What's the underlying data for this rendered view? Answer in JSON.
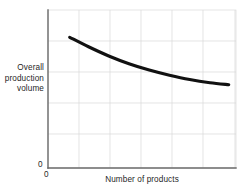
{
  "chart_data": {
    "type": "line",
    "title": "",
    "subtitle": "",
    "xlabel": "Number of products",
    "ylabel": "Overall production volume",
    "ylabel_lines": [
      "Overall",
      "production",
      "volume"
    ],
    "x_origin_label": "0",
    "y_origin_label": "0",
    "grid": true,
    "legend": null,
    "xlim": [
      0,
      6.5
    ],
    "ylim": [
      0,
      5.5
    ],
    "x_tick_labels": [],
    "y_tick_labels": [],
    "x_gridline_values": [
      1,
      2,
      3,
      4,
      5,
      6
    ],
    "y_gridline_values": [
      0.5,
      1.5,
      2.5,
      3.5,
      4.5
    ],
    "annotations": [],
    "series": [
      {
        "name": "Overall production volume",
        "color": "#111111",
        "x": [
          0.75,
          1.4,
          2.1,
          2.8,
          3.5,
          4.2,
          4.9,
          5.6,
          6.25
        ],
        "y": [
          4.55,
          4.22,
          3.9,
          3.63,
          3.41,
          3.23,
          3.08,
          2.97,
          2.9
        ]
      }
    ]
  },
  "colors": {
    "curve": "#111111",
    "grid": "#d9d9d9",
    "axis": "#6b6b6b",
    "text": "#1f1f1f",
    "background": "#ffffff"
  }
}
